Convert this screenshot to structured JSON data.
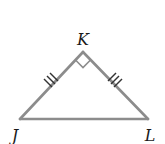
{
  "figure": {
    "type": "isosceles right triangle",
    "vertices": [
      {
        "name": "K",
        "label": "K",
        "x": 83,
        "y": 52,
        "label_x": 83,
        "label_y": 45
      },
      {
        "name": "J",
        "label": "J",
        "x": 20,
        "y": 119,
        "label_x": 15,
        "label_y": 141
      },
      {
        "name": "L",
        "label": "L",
        "x": 148,
        "y": 119,
        "label_x": 150,
        "label_y": 141
      }
    ],
    "sides": [
      {
        "name": "JK",
        "tick_marks": 3
      },
      {
        "name": "KL",
        "tick_marks": 3
      },
      {
        "name": "JL",
        "tick_marks": 0
      }
    ],
    "right_angle_at": "K",
    "colors": {
      "stroke": "#8c8c8c",
      "ticks": "#333333",
      "label": "#1a1a1a",
      "background": "#ffffff"
    }
  }
}
